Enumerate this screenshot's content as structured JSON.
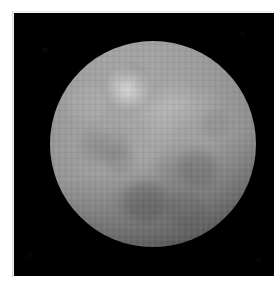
{
  "figure": {
    "name": "planetary-disk-grayscale-image",
    "kind": "astronomical-image",
    "alt_text": "",
    "caption": "",
    "background_color": "#ffffff"
  },
  "image_frame": {
    "name": "black-sky-frame",
    "background_color": "#000000",
    "left_px": 14,
    "top_px": 13,
    "width_px": 260,
    "height_px": 263
  },
  "disk": {
    "name": "planet-disk",
    "center_x_px": 153,
    "center_y_px": 144,
    "radius_px": 103,
    "core_color": "#a6a6a6",
    "mid_color": "#949494",
    "limb_color": "#3d3d3d",
    "sky_color": "#000000",
    "illumination": "near-full-disk-with-limb-darkening",
    "texture": "blocky-upscaled-pixels"
  },
  "features": [
    {
      "name": "bright-spot-primary",
      "center_x_px": 128,
      "center_y_px": 88,
      "radius_px": 22,
      "peak_color": "#e8e8e8",
      "description": "bright albedo spot, upper-left quadrant"
    },
    {
      "name": "bright-patch-secondary",
      "center_x_px": 162,
      "center_y_px": 112,
      "radius_px": 29,
      "peak_color": "#d6d6d6",
      "description": "faint lighter mottled region, upper-middle"
    },
    {
      "name": "dark-albedo-region-west",
      "center_x_px": 91,
      "center_y_px": 146,
      "description": "subtle dark patch on the left half"
    },
    {
      "name": "dark-albedo-region-center",
      "center_x_px": 171,
      "center_y_px": 168,
      "description": "subtle dark patch right of center"
    },
    {
      "name": "dark-albedo-region-south",
      "center_x_px": 133,
      "center_y_px": 201,
      "description": "subtle dark patch toward the southern limb"
    }
  ],
  "annotations": {
    "labels": [],
    "scale_bar": null,
    "north_arrow": null,
    "colorbar": null,
    "title": null
  },
  "overlay_text": []
}
